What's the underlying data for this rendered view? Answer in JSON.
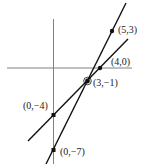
{
  "diagram": {
    "type": "coordinate-graph",
    "colors": {
      "axis": "#808080",
      "line": "#111111",
      "point": "#111111",
      "label": "#222222"
    },
    "lines": [
      {
        "name": "steep-line",
        "passes_through": [
          "(5,3)",
          "(3,-1)",
          "(0,-7)"
        ]
      },
      {
        "name": "shallow-line",
        "passes_through": [
          "(4,0)",
          "(3,-1)",
          "(0,-4)"
        ]
      }
    ],
    "points": {
      "p53": "(5,3)",
      "p40": "(4,0)",
      "p3m1": "(3,−1)",
      "p0m4": "(0,−4)",
      "p0m7": "(0,−7)"
    }
  }
}
